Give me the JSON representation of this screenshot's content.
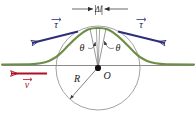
{
  "figure": {
    "width": 196,
    "height": 125,
    "background_color": "#ffffff"
  },
  "colors": {
    "curve_green": "#6d8f45",
    "tau_blue": "#2b2f77",
    "velocity_red": "#b01020",
    "circle_gray": "#8a8a8a",
    "baseline_gray": "#7d7d7d",
    "text_black": "#1a1a1a"
  },
  "labels": {
    "delta_l": "Δl",
    "theta_left": "θ",
    "theta_right": "θ",
    "radius": "R",
    "center": "O",
    "tau_left": "τ",
    "tau_right": "τ",
    "velocity": "v"
  },
  "vectors": [
    {
      "name": "tau-left",
      "symbol": "τ",
      "color": "#2b2f77",
      "direction": "up-left",
      "arrowhead": "open",
      "label_position": "above-midpoint"
    },
    {
      "name": "tau-right",
      "symbol": "τ",
      "color": "#2b2f77",
      "direction": "down-right",
      "arrowhead": "open",
      "label_position": "above-midpoint"
    },
    {
      "name": "velocity",
      "symbol": "v",
      "color": "#b01020",
      "direction": "left",
      "arrowhead": "open",
      "label_position": "below-midpoint"
    }
  ],
  "geometry": {
    "center_point_label": "O",
    "radius_label": "R",
    "circle_center_x": 98,
    "circle_center_y": 68,
    "circle_radius": 42,
    "baseline_y": 65,
    "arc_angle_label": "θ",
    "contact_gap_label": "Δl"
  },
  "elements": {
    "green_curve_name": "deformation-profile-curve",
    "circle_name": "wheel-circle",
    "baseline_name": "ground-baseline",
    "center_dot_name": "center-point"
  }
}
